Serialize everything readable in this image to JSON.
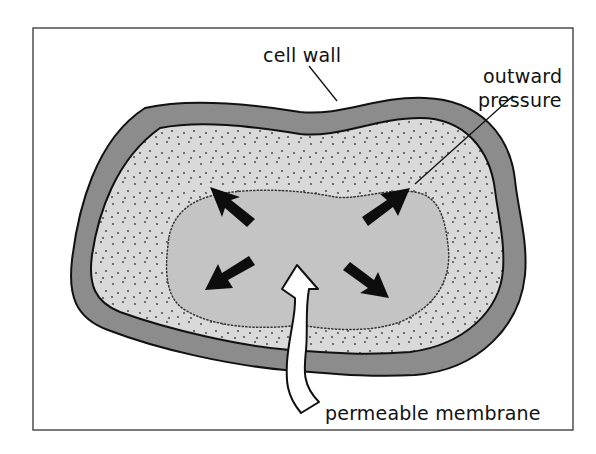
{
  "diagram": {
    "type": "plant cell turgor pressure illustration",
    "labels": {
      "cell_wall": "cell wall",
      "outward_pressure_line1": "outward",
      "outward_pressure_line2": "pressure",
      "permeable_membrane": "permeable membrane"
    },
    "elements": [
      {
        "id": "frame",
        "kind": "border rectangle"
      },
      {
        "id": "cell-wall",
        "kind": "thick dark-gray outer band"
      },
      {
        "id": "cytoplasm",
        "kind": "light-gray stippled region"
      },
      {
        "id": "vacuole",
        "kind": "gray region with dotted boundary"
      },
      {
        "id": "pressure-arrows",
        "kind": "four black arrows pointing outward",
        "count": 4
      },
      {
        "id": "water-inflow-arrow",
        "kind": "white curved arrow entering through wall"
      }
    ],
    "colors": {
      "frame": "#333333",
      "outline": "#111111",
      "cell_wall": "#8c8c8c",
      "cytoplasm": "#d9d9d9",
      "vacuole": "#c4c4c4",
      "stipple": "#555555",
      "arrow_black": "#0d0d0d",
      "arrow_white": "#ffffff",
      "background": "#ffffff"
    }
  }
}
